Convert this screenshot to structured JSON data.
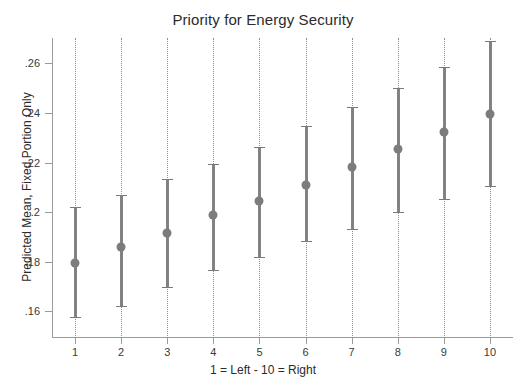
{
  "chart_data": {
    "type": "scatter",
    "title": "Priority for Energy Security",
    "xlabel": "1 = Left - 10 = Right",
    "ylabel": "Predicted Mean, Fixed Portion Only",
    "x": [
      1,
      2,
      3,
      4,
      5,
      6,
      7,
      8,
      9,
      10
    ],
    "categories": [
      "1",
      "2",
      "3",
      "4",
      "5",
      "6",
      "7",
      "8",
      "9",
      "10"
    ],
    "values": [
      0.1796,
      0.1859,
      0.1918,
      0.1989,
      0.2044,
      0.2111,
      0.2182,
      0.2253,
      0.2324,
      0.2395
    ],
    "ci_lower": [
      0.1578,
      0.1622,
      0.1697,
      0.1768,
      0.1819,
      0.1885,
      0.1933,
      0.2,
      0.2055,
      0.2106
    ],
    "ci_upper": [
      0.2019,
      0.207,
      0.2134,
      0.2193,
      0.2264,
      0.2347,
      0.2422,
      0.2501,
      0.2584,
      0.2688
    ],
    "xlim": [
      0.5,
      10.5
    ],
    "ylim": [
      0.1497,
      0.2702
    ],
    "ytick_values": [
      0.16,
      0.18,
      0.2,
      0.22,
      0.24,
      0.26
    ],
    "ytick_labels": [
      ".16",
      ".18",
      ".2",
      ".22",
      ".24",
      ".26"
    ],
    "xtick_labels": [
      "1",
      "2",
      "3",
      "4",
      "5",
      "6",
      "7",
      "8",
      "9",
      "10"
    ],
    "grid": "vertical-dotted",
    "legend": "none",
    "marker_color": "#7c7c7c",
    "error_bar_color": "#7a7a7a",
    "axis_color": "#9a9a9a",
    "background": "#ffffff"
  }
}
